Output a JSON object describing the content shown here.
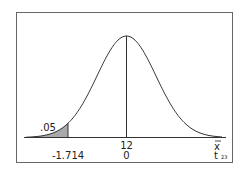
{
  "chart_data": {
    "type": "area",
    "title": "",
    "distribution": "t",
    "degrees_of_freedom": 23,
    "xlabel": "x̄",
    "x2label": "t",
    "x2label_subscript": "23",
    "center": {
      "xbar": "12",
      "t": "0"
    },
    "critical_value": {
      "t": "-1.714"
    },
    "shaded_area": {
      "label": ".05",
      "tail": "left",
      "color": "#a9a9a9"
    },
    "axis_tick_labels_xbar": [
      "12"
    ],
    "axis_tick_labels_t": [
      "-1.714",
      "0"
    ],
    "grid": false,
    "legend": "none"
  },
  "labels": {
    "alpha": ".05",
    "critical": "-1.714",
    "mean_xbar": "12",
    "mean_t": "0",
    "axis_xbar": "x",
    "axis_t": "t",
    "axis_t_sub": "23"
  },
  "colors": {
    "curve": "#333333",
    "shade": "#a9a9a9",
    "frame": "#666666"
  }
}
